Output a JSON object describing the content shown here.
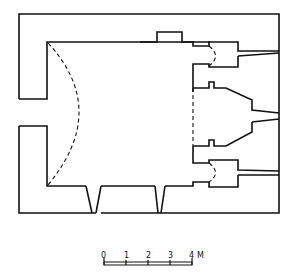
{
  "diagram": {
    "type": "architectural floor plan",
    "scale_bar": {
      "ticks": [
        "0",
        "1",
        "2",
        "3",
        "4"
      ],
      "unit": "M"
    }
  }
}
